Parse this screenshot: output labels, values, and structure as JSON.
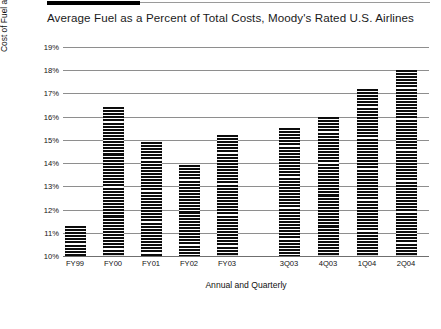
{
  "chart_data": {
    "type": "bar",
    "title": "Average Fuel as a Percent of Total Costs, Moody's Rated U.S. Airlines",
    "xlabel": "Annual and Quarterly",
    "ylabel": "Cost of Fuel as % of Operating Costs",
    "categories": [
      "FY99",
      "FY00",
      "FY01",
      "FY02",
      "FY03",
      "3Q03",
      "4Q03",
      "1Q04",
      "2Q04"
    ],
    "values": [
      11.3,
      16.4,
      14.9,
      13.9,
      15.2,
      15.5,
      16.0,
      17.2,
      18.0
    ],
    "ylim": [
      10,
      19
    ],
    "ytick_labels": [
      "19%",
      "18%",
      "17%",
      "16%",
      "15%",
      "14%",
      "13%",
      "12%",
      "11%",
      "10%"
    ],
    "ytick_values": [
      19,
      18,
      17,
      16,
      15,
      14,
      13,
      12,
      11,
      10
    ],
    "grid": true,
    "legend": "none",
    "bar_color": "#141414",
    "grid_color": "#8e8e8e"
  },
  "footer": {
    "marks": ""
  }
}
